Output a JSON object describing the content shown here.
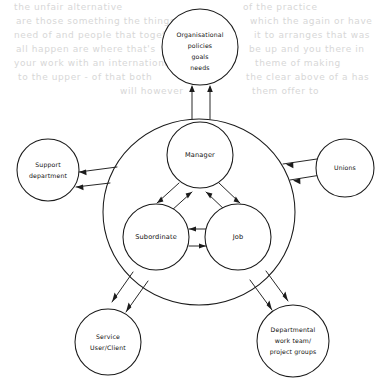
{
  "diagram": {
    "type": "systems-role-diagram",
    "title_visible": false,
    "colors": {
      "stroke": "#1b1b1b",
      "fill": "#ffffff",
      "text": "#101010",
      "bleed_through": "#d7d7d7"
    },
    "core": {
      "boundary_label": "",
      "nodes": [
        {
          "id": "manager",
          "label": "Manager",
          "cx": 200,
          "cy": 155,
          "r": 33
        },
        {
          "id": "subordinate",
          "label": "Subordinate",
          "cx": 156,
          "cy": 237,
          "r": 33
        },
        {
          "id": "job",
          "label": "Job",
          "cx": 238,
          "cy": 237,
          "r": 33
        }
      ],
      "links": [
        {
          "from": "manager",
          "to": "subordinate",
          "style": "double-line",
          "arrows": "bidirectional"
        },
        {
          "from": "manager",
          "to": "job",
          "style": "double-line",
          "arrows": "bidirectional"
        },
        {
          "from": "subordinate",
          "to": "job",
          "style": "double-line",
          "arrows": "bidirectional"
        }
      ]
    },
    "external": [
      {
        "id": "organisational",
        "position": "top",
        "lines": [
          "Organisational",
          "policies",
          "goals",
          "needs"
        ],
        "cx": 200,
        "cy": 47,
        "r": 38,
        "arrows": "bidirectional"
      },
      {
        "id": "support-department",
        "position": "left",
        "lines": [
          "Support",
          "department"
        ],
        "cx": 48,
        "cy": 170,
        "r": 31,
        "arrows": "bidirectional"
      },
      {
        "id": "unions",
        "position": "right",
        "lines": [
          "Unions"
        ],
        "cx": 345,
        "cy": 168,
        "r": 29,
        "arrows": "bidirectional"
      },
      {
        "id": "service-user-client",
        "position": "bottom-left",
        "lines": [
          "Service",
          "User/Client"
        ],
        "cx": 108,
        "cy": 342,
        "r": 33,
        "arrows": "bidirectional"
      },
      {
        "id": "departmental-work-team",
        "position": "bottom-right",
        "lines": [
          "Departmental",
          "work team/",
          "project groups"
        ],
        "cx": 293,
        "cy": 341,
        "r": 36,
        "arrows": "bidirectional"
      }
    ],
    "background_bleed": [
      {
        "text": "the  unfair  alternative",
        "x": 14,
        "y": 10
      },
      {
        "text": "are those  something  the things",
        "x": 16,
        "y": 24
      },
      {
        "text": "need of  and  people  that together",
        "x": 14,
        "y": 38
      },
      {
        "text": "all happen  are  where  that's",
        "x": 16,
        "y": 52
      },
      {
        "text": "your  work  with  an international",
        "x": 14,
        "y": 66
      },
      {
        "text": "to  the  upper   - of  that  both",
        "x": 18,
        "y": 80
      },
      {
        "text": "will  however",
        "x": 120,
        "y": 94
      },
      {
        "text": "of  the  practice",
        "x": 243,
        "y": 10
      },
      {
        "text": "which  the  again  or  have",
        "x": 250,
        "y": 24
      },
      {
        "text": "it  to  arranges   that  was",
        "x": 254,
        "y": 38
      },
      {
        "text": "be  up  and  you   there  in",
        "x": 249,
        "y": 52
      },
      {
        "text": "theme  of  making",
        "x": 255,
        "y": 66
      },
      {
        "text": "the  clear  above  of  a  has",
        "x": 246,
        "y": 80
      },
      {
        "text": "them  offer  to",
        "x": 252,
        "y": 94
      }
    ]
  }
}
